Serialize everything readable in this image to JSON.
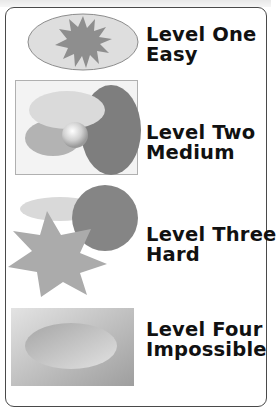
{
  "levels": [
    {
      "title": "Level One",
      "difficulty": "Easy",
      "icon": "starburst-in-ellipse-icon"
    },
    {
      "title": "Level Two",
      "difficulty": "Medium",
      "icon": "overlapping-ellipses-sphere-icon"
    },
    {
      "title": "Level Three",
      "difficulty": "Hard",
      "icon": "star-circle-ellipse-icon"
    },
    {
      "title": "Level Four",
      "difficulty": "Impossible",
      "icon": "ellipse-in-gradient-box-icon"
    }
  ],
  "colors": {
    "text": "#111111",
    "border": "#4a4a4a",
    "shape_light": "#dcdcdc",
    "shape_mid": "#a9a9a9",
    "shape_dark": "#7f7f7f"
  }
}
